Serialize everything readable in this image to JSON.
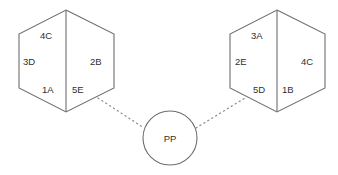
{
  "diagram": {
    "type": "node-link",
    "background_color": "#ffffff",
    "stroke_color": "#6e6e6e",
    "connector_color": "#8a8a8a",
    "text_color": "#2f2f2f",
    "left_hexagon": {
      "name": "left-hexagon",
      "has_center_divider": true,
      "labels": {
        "top_left": "4C",
        "middle_left": "3D",
        "bottom_left": "1A",
        "middle_right": "2B",
        "bottom_right": "5E"
      }
    },
    "right_hexagon": {
      "name": "right-hexagon",
      "has_center_divider": true,
      "labels": {
        "top_left": "3A",
        "middle_left": "2E",
        "bottom_left": "5D",
        "middle_right": "4C",
        "bottom_right": "1B"
      }
    },
    "hub_circle": {
      "name": "hub-circle",
      "label": "PP"
    },
    "connectors": [
      {
        "name": "connector-left",
        "style": "dotted",
        "from": "left-hexagon",
        "to": "hub-circle"
      },
      {
        "name": "connector-right",
        "style": "dotted",
        "from": "hub-circle",
        "to": "right-hexagon"
      }
    ]
  }
}
